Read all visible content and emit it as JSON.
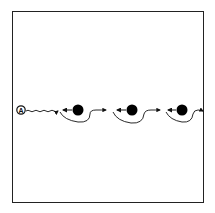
{
  "diagram": {
    "start_label": "A",
    "colors": {
      "stroke": "#111111",
      "frame": "#222222",
      "node_fill": "#000000",
      "background": "#ffffff"
    },
    "nodes": [
      {
        "id": "node-1",
        "cx": 78,
        "cy": 110,
        "r": 5.5
      },
      {
        "id": "node-2",
        "cx": 132,
        "cy": 110,
        "r": 5.5
      },
      {
        "id": "node-3",
        "cx": 182,
        "cy": 110,
        "r": 5.5
      }
    ]
  }
}
